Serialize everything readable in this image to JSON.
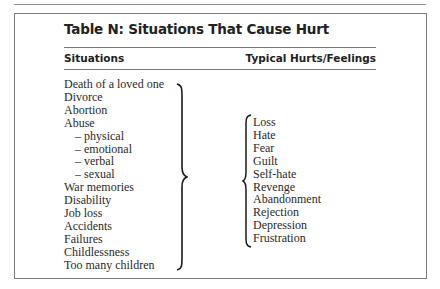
{
  "table": {
    "title": "Table N: Situations That Cause Hurt",
    "columns": {
      "left": "Situations",
      "right": "Typical Hurts/Feelings"
    },
    "situations": [
      {
        "label": "Death of a loved one",
        "sub": false
      },
      {
        "label": "Divorce",
        "sub": false
      },
      {
        "label": "Abortion",
        "sub": false
      },
      {
        "label": "Abuse",
        "sub": false
      },
      {
        "label": "– physical",
        "sub": true
      },
      {
        "label": "– emotional",
        "sub": true
      },
      {
        "label": "– verbal",
        "sub": true
      },
      {
        "label": "– sexual",
        "sub": true
      },
      {
        "label": "War memories",
        "sub": false
      },
      {
        "label": "Disability",
        "sub": false
      },
      {
        "label": "Job loss",
        "sub": false
      },
      {
        "label": "Accidents",
        "sub": false
      },
      {
        "label": "Failures",
        "sub": false
      },
      {
        "label": "Childlessness",
        "sub": false
      },
      {
        "label": "Too many children",
        "sub": false
      }
    ],
    "feelings": [
      "Loss",
      "Hate",
      "Fear",
      "Guilt",
      "Self-hate",
      "Revenge",
      "Abandonment",
      "Rejection",
      "Depression",
      "Frustration"
    ]
  }
}
